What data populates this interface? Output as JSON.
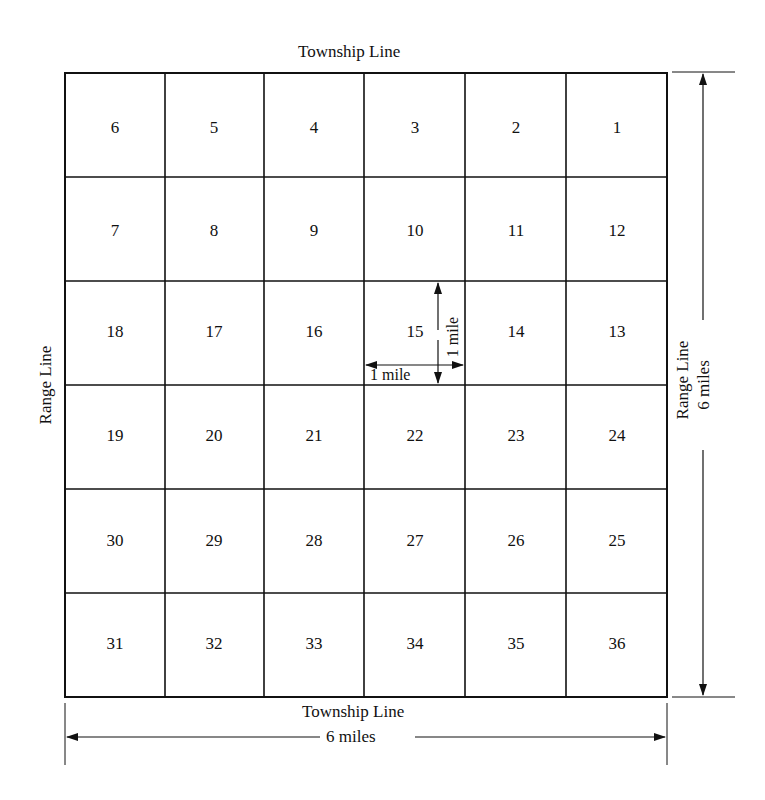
{
  "diagram": {
    "title_top": "Township Line",
    "title_bottom": "Township Line",
    "left_label": "Range Line",
    "right_label": "Range Line",
    "right_dimension": "6 miles",
    "bottom_dimension": "6 miles",
    "section_height_label": "1 mile",
    "section_width_label": "1 mile",
    "grid": {
      "rows": [
        [
          "6",
          "5",
          "4",
          "3",
          "2",
          "1"
        ],
        [
          "7",
          "8",
          "9",
          "10",
          "11",
          "12"
        ],
        [
          "18",
          "17",
          "16",
          "15",
          "14",
          "13"
        ],
        [
          "19",
          "20",
          "21",
          "22",
          "23",
          "24"
        ],
        [
          "30",
          "29",
          "28",
          "27",
          "26",
          "25"
        ],
        [
          "31",
          "32",
          "33",
          "34",
          "35",
          "36"
        ]
      ]
    },
    "colors": {
      "line": "#111111",
      "background": "#ffffff"
    }
  }
}
